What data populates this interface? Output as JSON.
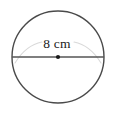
{
  "figure": {
    "kind": "geometry-diagram",
    "shape": "circle",
    "background_color": "#ffffff",
    "labels": {
      "diameter_label": "8 cm"
    },
    "measurements": {
      "diameter_value": "8",
      "unit": "cm"
    },
    "geometry": {
      "center_x": 58,
      "center_y": 57,
      "radius": 46,
      "diameter_line_y": 57,
      "diameter_line_x1": 12,
      "diameter_line_x2": 104,
      "center_dot_radius": 2.1,
      "label_x": 57,
      "label_y": 48,
      "guide_arc_left_d": "M 15 63 Q 26 45 42 42",
      "guide_arc_right_d": "M 74 42 Q 90 45 101 63"
    },
    "colors": {
      "circle_stroke": "#4a4a4a",
      "diameter_stroke": "#555555",
      "center_dot_fill": "#1a1a1a",
      "guide_arc_stroke": "#d9d9d9",
      "label_color": "#1c1c1c"
    },
    "stroke_widths": {
      "circle": "1.4",
      "diameter": "1.3",
      "guide_arc": "1.1"
    }
  }
}
